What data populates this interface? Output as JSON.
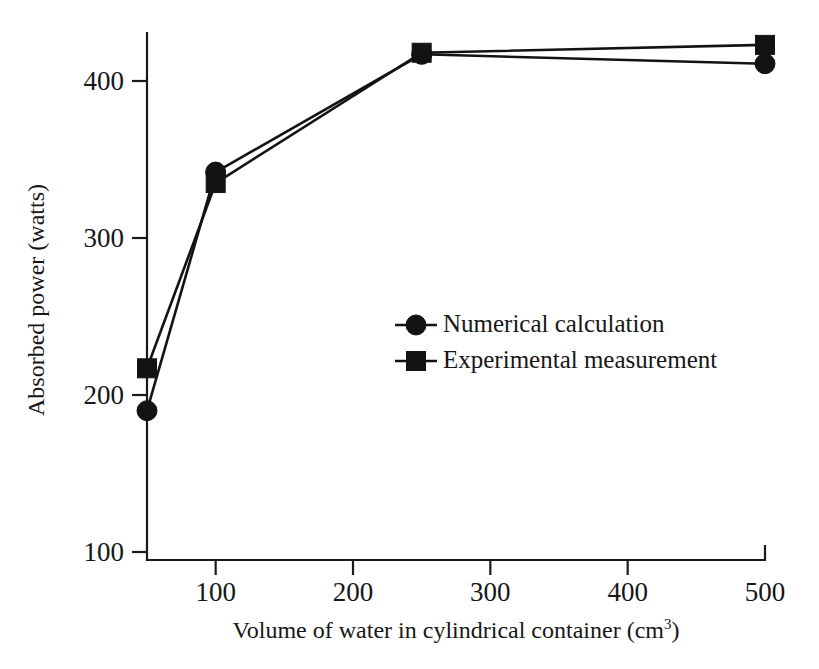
{
  "chart_data": {
    "type": "line",
    "title": "",
    "xlabel": "Volume of water in cylindrical container (cm3)",
    "xlabel_main": "Volume of water in cylindrical container (cm",
    "xlabel_sup": "3",
    "xlabel_tail": ")",
    "ylabel": "Absorbed power (watts)",
    "x": [
      50,
      100,
      250,
      500
    ],
    "xlim": [
      50,
      500
    ],
    "ylim": [
      100,
      440
    ],
    "xticks": [
      100,
      200,
      300,
      400,
      500
    ],
    "xticklabels": [
      "100",
      "200",
      "300",
      "400",
      "500"
    ],
    "yticks": [
      100,
      200,
      300,
      400
    ],
    "yticklabels": [
      "100",
      "200",
      "300",
      "400"
    ],
    "grid": false,
    "legend_position": "center-right",
    "series": [
      {
        "name": "Numerical calculation",
        "marker": "circle",
        "color": "#131313",
        "values": [
          190,
          342,
          417,
          411
        ]
      },
      {
        "name": "Experimental measurement",
        "marker": "square",
        "color": "#131313",
        "values": [
          217,
          335,
          418,
          423
        ]
      }
    ]
  },
  "figure": {
    "background": "#ffffff",
    "ink_color": "#131313"
  }
}
